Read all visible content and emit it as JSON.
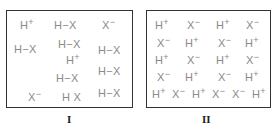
{
  "panels": [
    {
      "label": "I",
      "species": [
        {
          "base": "H",
          "sup": "+",
          "x": 20,
          "y": 20
        },
        {
          "base": "H−X",
          "sup": "",
          "x": 54,
          "y": 20
        },
        {
          "base": "X",
          "sup": "−",
          "x": 102,
          "y": 20
        },
        {
          "base": "H−X",
          "sup": "",
          "x": 14,
          "y": 44
        },
        {
          "base": "H−X",
          "sup": "",
          "x": 58,
          "y": 39
        },
        {
          "base": "H−X",
          "sup": "",
          "x": 98,
          "y": 45
        },
        {
          "base": "H",
          "sup": "+",
          "x": 66,
          "y": 55
        },
        {
          "base": "H−X",
          "sup": "",
          "x": 98,
          "y": 66
        },
        {
          "base": "H−X",
          "sup": "",
          "x": 56,
          "y": 73
        },
        {
          "base": "X",
          "sup": "−",
          "x": 28,
          "y": 92
        },
        {
          "base": "H X",
          "sup": "",
          "x": 62,
          "y": 92
        },
        {
          "base": "H−X",
          "sup": "",
          "x": 98,
          "y": 88
        }
      ]
    },
    {
      "label": "II",
      "species": [
        {
          "base": "H",
          "sup": "+",
          "x": 155,
          "y": 20
        },
        {
          "base": "X",
          "sup": "−",
          "x": 187,
          "y": 20
        },
        {
          "base": "H",
          "sup": "+",
          "x": 216,
          "y": 20
        },
        {
          "base": "X",
          "sup": "−",
          "x": 246,
          "y": 20
        },
        {
          "base": "X",
          "sup": "−",
          "x": 157,
          "y": 38
        },
        {
          "base": "H",
          "sup": "+",
          "x": 185,
          "y": 38
        },
        {
          "base": "X",
          "sup": "−",
          "x": 218,
          "y": 38
        },
        {
          "base": "H",
          "sup": "+",
          "x": 245,
          "y": 38
        },
        {
          "base": "H",
          "sup": "+",
          "x": 155,
          "y": 55
        },
        {
          "base": "X",
          "sup": "−",
          "x": 187,
          "y": 55
        },
        {
          "base": "H",
          "sup": "+",
          "x": 216,
          "y": 55
        },
        {
          "base": "X",
          "sup": "−",
          "x": 246,
          "y": 55
        },
        {
          "base": "X",
          "sup": "−",
          "x": 157,
          "y": 72
        },
        {
          "base": "H",
          "sup": "+",
          "x": 185,
          "y": 72
        },
        {
          "base": "X",
          "sup": "−",
          "x": 218,
          "y": 72
        },
        {
          "base": "H",
          "sup": "+",
          "x": 245,
          "y": 72
        },
        {
          "base": "H",
          "sup": "+",
          "x": 152,
          "y": 89
        },
        {
          "base": "X",
          "sup": "−",
          "x": 172,
          "y": 89
        },
        {
          "base": "H",
          "sup": "+",
          "x": 192,
          "y": 89
        },
        {
          "base": "X",
          "sup": "−",
          "x": 212,
          "y": 89
        },
        {
          "base": "X",
          "sup": "−",
          "x": 232,
          "y": 89
        },
        {
          "base": "H",
          "sup": "+",
          "x": 252,
          "y": 89
        }
      ]
    }
  ]
}
